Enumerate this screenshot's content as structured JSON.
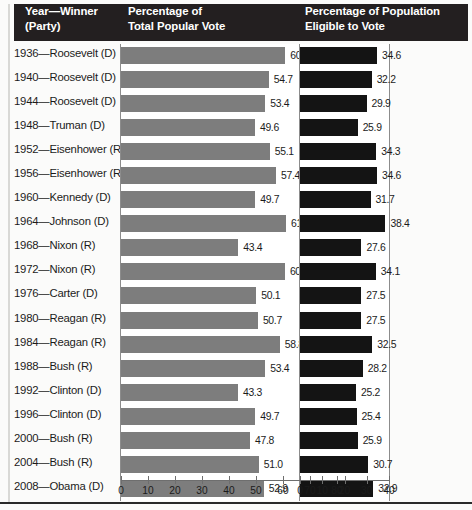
{
  "header": {
    "columns": [
      {
        "name": "year-winner",
        "lines": [
          "Year—Winner",
          "(Party)"
        ]
      },
      {
        "name": "total-popular-vote",
        "lines": [
          "Percentage of",
          "Total Popular Vote"
        ]
      },
      {
        "name": "eligible-population",
        "lines": [
          "Percentage of Population",
          "Eligible to Vote"
        ]
      }
    ]
  },
  "chart_data": {
    "type": "bar",
    "orientation": "horizontal",
    "title": "",
    "categories": [
      "1936—Roosevelt (D)",
      "1940—Roosevelt (D)",
      "1944—Roosevelt (D)",
      "1948—Truman (D)",
      "1952—Eisenhower (R)",
      "1956—Eisenhower (R)",
      "1960—Kennedy (D)",
      "1964—Johnson (D)",
      "1968—Nixon (R)",
      "1972—Nixon (R)",
      "1976—Carter (D)",
      "1980—Reagan (R)",
      "1984—Reagan (R)",
      "1988—Bush (R)",
      "1992—Clinton (D)",
      "1996—Clinton (D)",
      "2000—Bush (R)",
      "2004—Bush (R)",
      "2008—Obama (D)"
    ],
    "series": [
      {
        "name": "Percentage of Total Popular Vote",
        "color": "#7d7d7d",
        "axis": "left",
        "xlim": [
          0,
          80
        ],
        "ticks": [
          0,
          10,
          20,
          30,
          40,
          50,
          60,
          70,
          80
        ],
        "values": [
          60.8,
          54.7,
          53.4,
          49.6,
          55.1,
          57.4,
          49.7,
          61.1,
          43.4,
          60.7,
          50.1,
          50.7,
          58.8,
          53.4,
          43.3,
          49.7,
          47.8,
          51.0,
          52.9
        ],
        "labels": [
          "60.8",
          "54.7",
          "53.4",
          "49.6",
          "55.1",
          "57.4",
          "49.7",
          "61.1",
          "43.4",
          "60.7",
          "50.1",
          "50.7",
          "58.8",
          "53.4",
          "43.3",
          "49.7",
          "47.8",
          "51.0",
          "52.9"
        ]
      },
      {
        "name": "Percentage of Population Eligible to Vote",
        "color": "#141414",
        "axis": "right",
        "xlim": [
          0,
          40
        ],
        "ticks": [
          0,
          10,
          20,
          30,
          40
        ],
        "values": [
          34.6,
          32.2,
          29.9,
          25.9,
          34.3,
          34.6,
          31.7,
          38.4,
          27.6,
          34.1,
          27.5,
          27.5,
          32.5,
          28.2,
          25.2,
          25.4,
          25.9,
          30.7,
          32.9
        ],
        "labels": [
          "34.6",
          "32.2",
          "29.9",
          "25.9",
          "34.3",
          "34.6",
          "31.7",
          "38.4",
          "27.6",
          "34.1",
          "27.5",
          "27.5",
          "32.5",
          "28.2",
          "25.2",
          "25.4",
          "25.9",
          "30.7",
          "32.9"
        ]
      }
    ],
    "xlabel": "",
    "ylabel": "",
    "grid": false,
    "legend": "none"
  },
  "colors": {
    "header_band": "#231f20",
    "bar_left": "#7d7d7d",
    "bar_right": "#141414",
    "text": "#1b1b1b",
    "axis": "#6e6e6e"
  }
}
